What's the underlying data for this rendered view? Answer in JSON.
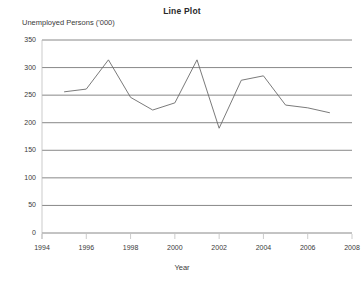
{
  "chart_data": {
    "type": "line",
    "title": "Line Plot",
    "xlabel": "Year",
    "ylabel": "Unemployed Persons ('000)",
    "x": [
      1995,
      1996,
      1997,
      1998,
      1999,
      2000,
      2001,
      2002,
      2003,
      2004,
      2005,
      2006,
      2007
    ],
    "values": [
      256,
      261,
      314,
      246,
      223,
      236,
      314,
      190,
      277,
      285,
      232,
      227,
      218
    ],
    "series": [
      {
        "name": "Unemployed Persons ('000)",
        "values": [
          256,
          261,
          314,
          246,
          223,
          236,
          314,
          190,
          277,
          285,
          232,
          227,
          218
        ]
      }
    ],
    "xlim": [
      1994,
      2008
    ],
    "ylim": [
      0,
      350
    ],
    "xticks": [
      1994,
      1996,
      1998,
      2000,
      2002,
      2004,
      2006,
      2008
    ],
    "yticks": [
      0,
      50,
      100,
      150,
      200,
      250,
      300,
      350
    ],
    "xtick_labels": [
      "1994",
      "1996",
      "1998",
      "2000",
      "2002",
      "2004",
      "2006",
      "2008"
    ],
    "ytick_labels": [
      "0",
      "50",
      "100",
      "150",
      "200",
      "250",
      "300",
      "350"
    ],
    "grid": "horizontal",
    "legend": "none",
    "line_color": "#6b6b6b",
    "grid_color": "#7a7a7a",
    "axis_color": "#b5b5b5",
    "background": "#ffffff"
  }
}
